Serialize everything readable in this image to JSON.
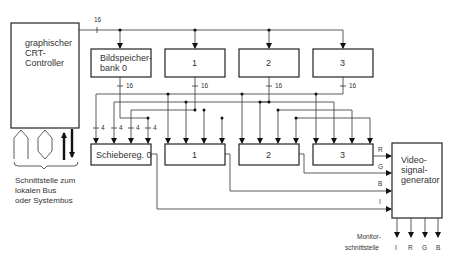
{
  "diagram": {
    "controller": {
      "lines": [
        "graphischer",
        "CRT-",
        "Controller"
      ]
    },
    "frame_buffers": [
      {
        "lines": [
          "Bildspeicher-",
          "bank 0"
        ]
      },
      {
        "lines": [
          "1"
        ]
      },
      {
        "lines": [
          "2"
        ]
      },
      {
        "lines": [
          "3"
        ]
      }
    ],
    "shift_registers": [
      {
        "label": "Schiebereg. 0"
      },
      {
        "label": "1"
      },
      {
        "label": "2"
      },
      {
        "label": "3"
      }
    ],
    "video_generator": {
      "lines": [
        "Video-",
        "signal-",
        "generator"
      ]
    },
    "bus_width_labels": {
      "top": "16",
      "bank_out": "16",
      "register_in": "4"
    },
    "signal_inputs": [
      "R",
      "G",
      "B",
      "I"
    ],
    "bus_interface": {
      "lines": [
        "Schnittstelle zum",
        "lokalen Bus",
        "oder Systembus"
      ]
    },
    "monitor_interface": {
      "lines": [
        "Monitor-",
        "schnittstelle"
      ],
      "outputs": [
        "I",
        "R",
        "G",
        "B"
      ]
    }
  }
}
